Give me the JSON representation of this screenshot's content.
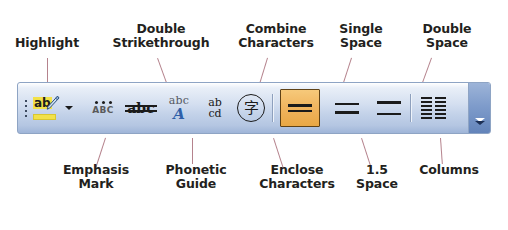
{
  "figure": {
    "type": "annotated-toolbar-diagram"
  },
  "colors": {
    "leader_line": "#b5838d",
    "label_text": "#231f20",
    "toolbar_border": "#8ea4c4",
    "toolbar_gradient_top": "#e9eff8",
    "toolbar_gradient_bottom": "#9fb5d8",
    "selected_button_fill": "#f0b45e",
    "selected_button_border": "#5f4216",
    "highlight_yellow": "#f2e14a",
    "phonetic_blue": "#2f5fa8",
    "overflow_panel": "#7f9ccb"
  },
  "callouts": {
    "top": [
      {
        "id": "highlight",
        "label": "Highlight"
      },
      {
        "id": "double-strikethrough",
        "label": "Double\nStrikethrough"
      },
      {
        "id": "combine-characters",
        "label": "Combine\nCharacters"
      },
      {
        "id": "single-space",
        "label": "Single\nSpace"
      },
      {
        "id": "double-space",
        "label": "Double\nSpace"
      }
    ],
    "bottom": [
      {
        "id": "emphasis-mark",
        "label": "Emphasis\nMark"
      },
      {
        "id": "phonetic-guide",
        "label": "Phonetic\nGuide"
      },
      {
        "id": "enclose-characters",
        "label": "Enclose\nCharacters"
      },
      {
        "id": "one-half-space",
        "label": "1.5\nSpace"
      },
      {
        "id": "columns",
        "label": "Columns"
      }
    ]
  },
  "toolbar": {
    "grip": {
      "icon": "drag-grip-icon",
      "dots": 4
    },
    "buttons": [
      {
        "id": "highlight",
        "icon": "highlight-icon",
        "tooltip": "Highlight",
        "glyph_text": "ab",
        "state": "normal",
        "has_dropdown": true
      },
      {
        "id": "emphasis-mark",
        "icon": "emphasis-mark-icon",
        "tooltip": "Emphasis Mark",
        "glyph_text": "ABC",
        "state": "normal"
      },
      {
        "id": "double-strikethrough",
        "icon": "double-strikethrough-icon",
        "tooltip": "Double Strikethrough",
        "glyph_text": "abc",
        "state": "normal"
      },
      {
        "id": "phonetic-guide",
        "icon": "phonetic-guide-icon",
        "tooltip": "Phonetic Guide",
        "glyph_small": "abc",
        "glyph_big": "A",
        "state": "normal"
      },
      {
        "id": "combine-characters",
        "icon": "combine-characters-icon",
        "tooltip": "Combine Characters",
        "glyph_top": "ab",
        "glyph_bottom": "cd",
        "state": "normal"
      },
      {
        "id": "enclose-characters",
        "icon": "enclose-characters-icon",
        "tooltip": "Enclose Characters",
        "glyph_text": "字",
        "state": "normal"
      },
      {
        "id": "single-space",
        "icon": "line-spacing-single-icon",
        "tooltip": "Single Space",
        "state": "selected"
      },
      {
        "id": "one-half-space",
        "icon": "line-spacing-1-5-icon",
        "tooltip": "1.5 Space",
        "state": "normal"
      },
      {
        "id": "double-space",
        "icon": "line-spacing-double-icon",
        "tooltip": "Double Space",
        "state": "normal"
      },
      {
        "id": "columns",
        "icon": "columns-icon",
        "tooltip": "Columns",
        "state": "normal"
      }
    ],
    "overflow": {
      "icon": "toolbar-options-chevron-icon",
      "tooltip": "Toolbar Options"
    }
  }
}
